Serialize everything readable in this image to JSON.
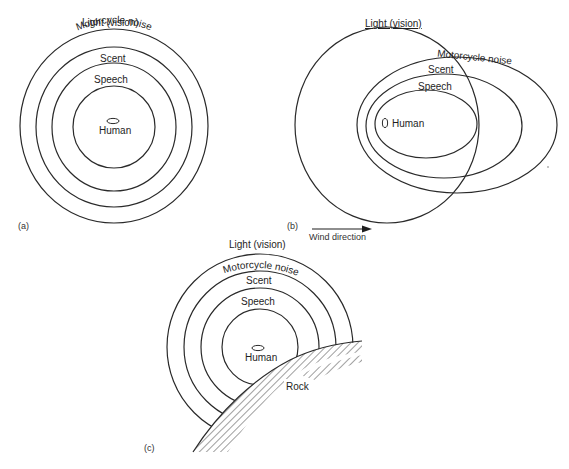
{
  "figure": {
    "panels": [
      {
        "id": "a",
        "caption": "(a)",
        "description": "Concentric detection zones with no wind",
        "zones": [
          {
            "label": "Light (vision)"
          },
          {
            "label": "Motorcycle noise"
          },
          {
            "label": "Scent"
          },
          {
            "label": "Speech"
          }
        ],
        "center_label": "Human"
      },
      {
        "id": "b",
        "caption": "(b)",
        "description": "Detection zones displaced downwind",
        "zones": [
          {
            "label": "Light (vision)"
          },
          {
            "label": "Motorcycle noise"
          },
          {
            "label": "Scent"
          },
          {
            "label": "Speech"
          }
        ],
        "center_label": "Human",
        "arrow_label": "Wind direction"
      },
      {
        "id": "c",
        "caption": "(c)",
        "description": "Detection zones truncated by rock",
        "zones": [
          {
            "label": "Light (vision)"
          },
          {
            "label": "Motorcycle noise"
          },
          {
            "label": "Scent"
          },
          {
            "label": "Speech"
          }
        ],
        "center_label": "Human",
        "obstacle_label": "Rock"
      }
    ]
  },
  "colors": {
    "line": "#2a2a2a",
    "text": "#1e1e1e",
    "background": "#ffffff"
  }
}
